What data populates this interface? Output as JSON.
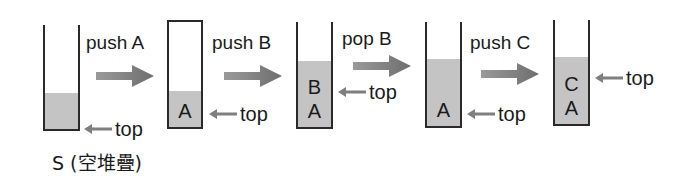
{
  "diagram": {
    "colors": {
      "outline": "#2a2a2a",
      "fill": "#c4c4c4",
      "arrow": "#7f7f7f",
      "text": "#1a1a1a"
    },
    "stacks": [
      {
        "id": "s0",
        "caption": "S (空堆疊)",
        "items": [],
        "top_label": "top"
      },
      {
        "id": "s1",
        "items": [
          "A"
        ],
        "top_label": "top"
      },
      {
        "id": "s2",
        "items": [
          "A",
          "B"
        ],
        "top_label": "top"
      },
      {
        "id": "s3",
        "items": [
          "A"
        ],
        "top_label": "top"
      },
      {
        "id": "s4",
        "items": [
          "A",
          "C"
        ],
        "top_label": "top"
      }
    ],
    "operations": [
      {
        "label": "push A"
      },
      {
        "label": "push B"
      },
      {
        "label": "pop B"
      },
      {
        "label": "push C"
      }
    ]
  }
}
